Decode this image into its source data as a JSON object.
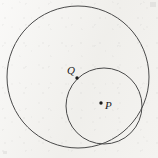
{
  "figure": {
    "width": 158,
    "height": 158,
    "background_color": "#f3f2ef",
    "stroke_color": "#4a4a4a",
    "label_color": "#1b1b1b"
  },
  "shapes": {
    "outer_circle": {
      "name": "large-circle",
      "cx": 78,
      "cy": 77,
      "r": 71,
      "stroke_width": 1
    },
    "inner_circle": {
      "name": "small-circle",
      "cx": 104,
      "cy": 106,
      "r": 38,
      "stroke_width": 1
    }
  },
  "points": [
    {
      "id": "Q",
      "label": "Q",
      "dot_x": 77,
      "dot_y": 78,
      "dot_r": 1.7,
      "label_x": 67,
      "label_y": 65
    },
    {
      "id": "P",
      "label": "P",
      "dot_x": 101,
      "dot_y": 103,
      "dot_r": 1.7,
      "label_x": 105,
      "label_y": 100
    }
  ],
  "chart_data": {
    "type": "scatter",
    "xlabel": "",
    "ylabel": "",
    "circles": [
      {
        "name": "large-circle",
        "center": [
          78,
          77
        ],
        "radius": 71
      },
      {
        "name": "small-circle",
        "center": [
          104,
          106
        ],
        "radius": 38
      }
    ],
    "points": [
      {
        "label": "Q",
        "x": 77,
        "y": 78
      },
      {
        "label": "P",
        "x": 101,
        "y": 103
      }
    ],
    "xlim": [
      0,
      158
    ],
    "ylim": [
      0,
      158
    ],
    "grid": false,
    "legend": "none"
  }
}
